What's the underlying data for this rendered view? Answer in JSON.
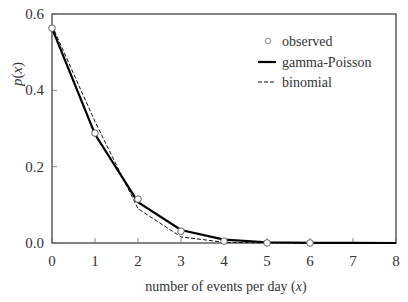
{
  "chart_data": {
    "type": "line",
    "title": "",
    "xlabel": "number of events per day (x)",
    "ylabel": "p(x)",
    "xlim": [
      0,
      8
    ],
    "ylim": [
      0,
      0.6
    ],
    "x_ticks": [
      "0",
      "1",
      "2",
      "3",
      "4",
      "5",
      "6",
      "7",
      "8"
    ],
    "y_ticks": [
      "0.0",
      "0.2",
      "0.4",
      "0.6"
    ],
    "grid": false,
    "legend_position": "upper right",
    "series": [
      {
        "name": "observed",
        "style": "open-circle markers",
        "x": [
          0,
          1,
          2,
          3,
          4,
          5,
          6
        ],
        "values": [
          0.563,
          0.288,
          0.115,
          0.031,
          0.005,
          0.0,
          0.0
        ]
      },
      {
        "name": "gamma-Poisson",
        "style": "solid thick line",
        "x": [
          0,
          1,
          2,
          3,
          4,
          5,
          6,
          7,
          8
        ],
        "values": [
          0.563,
          0.285,
          0.107,
          0.034,
          0.009,
          0.002,
          0.0005,
          0.0001,
          0.0
        ]
      },
      {
        "name": "binomial",
        "style": "dashed line",
        "x": [
          0,
          1,
          2,
          3,
          4,
          5,
          6,
          7,
          8
        ],
        "values": [
          0.57,
          0.318,
          0.09,
          0.016,
          0.002,
          0.0002,
          0.0,
          0.0,
          0.0
        ]
      }
    ]
  }
}
